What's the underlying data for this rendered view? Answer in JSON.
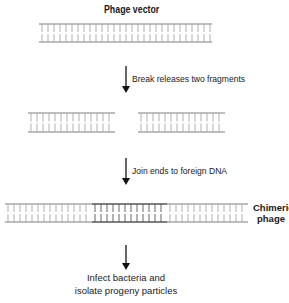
{
  "title": "Phage vector",
  "steps": [
    {
      "label": "Break releases two fragments"
    },
    {
      "label": "Join ends to foreign DNA"
    }
  ],
  "result_label": {
    "line1": "Chimeric",
    "line2": "phage"
  },
  "final_step": {
    "line1": "Infect bacteria and",
    "line2": "isolate progeny particles"
  },
  "colors": {
    "vector_dna": "#a8a8a8",
    "foreign_dna": "#555555",
    "arrow": "#111111",
    "text": "#222222"
  },
  "dna_segments": [
    {
      "name": "phage-vector",
      "x1": 39,
      "x2": 212,
      "y_top": 24,
      "y_bottom": 42,
      "type": "vector"
    },
    {
      "name": "left-fragment",
      "x1": 28,
      "x2": 115,
      "y_top": 113,
      "y_bottom": 132,
      "type": "vector"
    },
    {
      "name": "right-fragment",
      "x1": 138,
      "x2": 225,
      "y_top": 113,
      "y_bottom": 132,
      "type": "vector"
    },
    {
      "name": "chimeric-left-arm",
      "x1": 5,
      "x2": 92,
      "y_top": 204,
      "y_bottom": 222,
      "type": "vector"
    },
    {
      "name": "chimeric-foreign-insert",
      "x1": 92,
      "x2": 167,
      "y_top": 204,
      "y_bottom": 222,
      "type": "foreign"
    },
    {
      "name": "chimeric-right-arm",
      "x1": 167,
      "x2": 248,
      "y_top": 204,
      "y_bottom": 222,
      "type": "vector"
    }
  ]
}
